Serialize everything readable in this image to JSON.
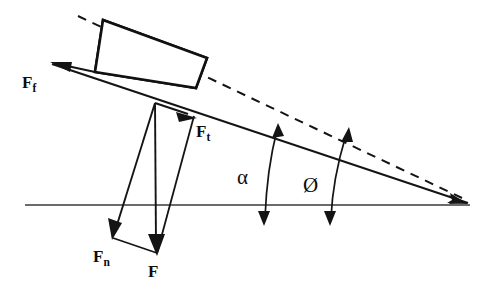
{
  "figure": {
    "background_color": "#ffffff",
    "ink_color": "#141414",
    "width": 489,
    "height": 295
  },
  "labels": {
    "friction_force": {
      "base": "F",
      "subscript": "f",
      "text": "Ff"
    },
    "tangential_force": {
      "base": "F",
      "subscript": "t",
      "text": "Ft"
    },
    "normal_force": {
      "base": "F",
      "subscript": "n",
      "text": "Fn"
    },
    "weight_force": {
      "base": "F",
      "subscript": "",
      "text": "F"
    }
  },
  "angles": {
    "alpha": {
      "symbol": "α",
      "name": "alpha"
    },
    "phi": {
      "symbol": "Ø",
      "name": "phi"
    }
  },
  "geometry": {
    "baseline": {
      "x1": 25,
      "y1": 205,
      "x2": 470,
      "y2": 205
    },
    "incline": {
      "x1": 52,
      "y1": 64,
      "x2": 468,
      "y2": 203
    },
    "dashed_line": {
      "x1": 78,
      "y1": 16,
      "x2": 466,
      "y2": 200
    },
    "apex": {
      "x": 468,
      "y": 204
    },
    "block": {
      "top_left": {
        "x": 103,
        "y": 20
      },
      "top_right": {
        "x": 207,
        "y": 58
      },
      "bottom_right": {
        "x": 196,
        "y": 88
      },
      "bottom_left": {
        "x": 95,
        "y": 72
      },
      "fill": "hatched"
    },
    "vector_origin": {
      "x": 155,
      "y": 103
    },
    "vectors": [
      {
        "name": "friction_force",
        "from": {
          "x": 95,
          "y": 72
        },
        "to": {
          "x": 53,
          "y": 63
        }
      },
      {
        "name": "tangential_force",
        "from": {
          "x": 155,
          "y": 103
        },
        "to": {
          "x": 194,
          "y": 116
        }
      },
      {
        "name": "normal_force",
        "from": {
          "x": 155,
          "y": 103
        },
        "to": {
          "x": 113,
          "y": 237
        }
      },
      {
        "name": "weight_force",
        "from": {
          "x": 155,
          "y": 103
        },
        "to": {
          "x": 157,
          "y": 253
        }
      }
    ],
    "parallelogram_closures": [
      {
        "from": {
          "x": 113,
          "y": 237
        },
        "to": {
          "x": 157,
          "y": 253
        }
      },
      {
        "from": {
          "x": 194,
          "y": 116
        },
        "to": {
          "x": 157,
          "y": 253
        }
      }
    ],
    "angle_arcs": [
      {
        "name": "alpha",
        "x": 273,
        "top": {
          "x": 277,
          "y": 126
        },
        "bottom": {
          "x": 264,
          "y": 223
        }
      },
      {
        "name": "phi",
        "x": 336,
        "top": {
          "x": 348,
          "y": 131
        },
        "bottom": {
          "x": 330,
          "y": 223
        }
      }
    ]
  },
  "label_positions": {
    "friction_force": {
      "x": 22,
      "y": 88
    },
    "tangential_force": {
      "x": 196,
      "y": 137
    },
    "normal_force": {
      "x": 93,
      "y": 262
    },
    "weight_force": {
      "x": 148,
      "y": 277
    },
    "alpha": {
      "x": 237,
      "y": 184
    },
    "phi": {
      "x": 303,
      "y": 192
    }
  }
}
